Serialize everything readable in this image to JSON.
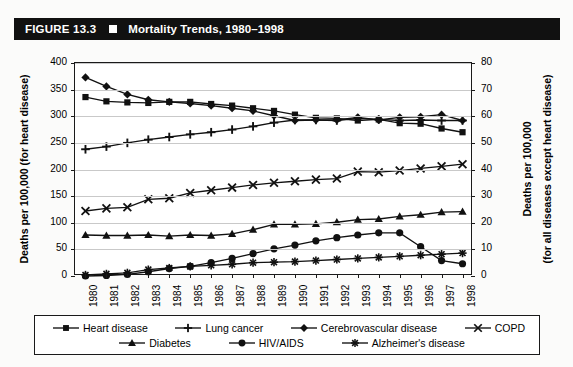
{
  "figure": {
    "number": "FIGURE 13.3",
    "title": "Mortality Trends, 1980–1998",
    "marker_icon": "filled-square-icon"
  },
  "chart_data": {
    "type": "line",
    "title": "Mortality Trends, 1980–1998",
    "xlabel": "",
    "ylabel": "Deaths per 100,000 (for heart disease)",
    "ylabel_right_line1": "Deaths per 100,000",
    "ylabel_right_line2": "(for all diseases except heart disease)",
    "x": [
      1980,
      1981,
      1982,
      1983,
      1984,
      1985,
      1986,
      1987,
      1988,
      1989,
      1990,
      1991,
      1992,
      1993,
      1994,
      1995,
      1996,
      1997,
      1998
    ],
    "xtick_labels": [
      "1980",
      "1981",
      "1982",
      "1983",
      "1984",
      "1985",
      "1986",
      "1987",
      "1988",
      "1989",
      "1990",
      "1991",
      "1992",
      "1993",
      "1994",
      "1995",
      "1996",
      "1997",
      "1998"
    ],
    "ylim": [
      0,
      400
    ],
    "yticks": [
      0,
      50,
      100,
      150,
      200,
      250,
      300,
      350,
      400
    ],
    "ylim_right": [
      0,
      80
    ],
    "yticks_right": [
      0,
      10,
      20,
      30,
      40,
      50,
      60,
      70,
      80
    ],
    "grid": true,
    "legend_position": "bottom",
    "series": [
      {
        "name": "Heart disease",
        "marker": "square",
        "axis": "left",
        "values": [
          336,
          328,
          326,
          325,
          327,
          327,
          323,
          320,
          315,
          310,
          303,
          297,
          296,
          292,
          294,
          287,
          286,
          277,
          270
        ]
      },
      {
        "name": "Lung cancer",
        "marker": "plus",
        "axis": "left",
        "values": [
          238,
          243,
          250,
          256,
          261,
          266,
          270,
          275,
          281,
          288,
          293,
          293,
          292,
          296,
          294,
          292,
          293,
          292,
          292
        ]
      },
      {
        "name": "Cerebrovascular disease",
        "marker": "diamond",
        "axis": "left",
        "values": [
          373,
          356,
          341,
          331,
          327,
          324,
          320,
          315,
          310,
          301,
          292,
          293,
          293,
          298,
          293,
          298,
          299,
          303,
          292
        ]
      },
      {
        "name": "COPD",
        "marker": "x",
        "axis": "right",
        "values": [
          24.4,
          25.4,
          25.8,
          28.8,
          29.2,
          31.2,
          32.2,
          33.2,
          34.2,
          35.0,
          35.6,
          36.2,
          36.6,
          39.2,
          39.0,
          39.6,
          40.4,
          41.2,
          42.0
        ]
      },
      {
        "name": "Diabetes",
        "marker": "triangle",
        "axis": "right",
        "values": [
          15.4,
          15.2,
          15.2,
          15.4,
          15.0,
          15.4,
          15.2,
          15.8,
          17.4,
          19.4,
          19.4,
          19.6,
          20.2,
          21.2,
          21.4,
          22.4,
          23.0,
          24.0,
          24.2
        ]
      },
      {
        "name": "HIV/AIDS",
        "marker": "circle",
        "axis": "right",
        "values": [
          0.0,
          0.2,
          0.6,
          1.6,
          2.8,
          3.6,
          5.0,
          6.6,
          8.4,
          10.2,
          11.6,
          13.2,
          14.4,
          15.4,
          16.2,
          16.2,
          11.0,
          5.8,
          4.6
        ]
      },
      {
        "name": "Alzheimer's disease",
        "marker": "asterisk",
        "axis": "right",
        "values": [
          0.4,
          0.8,
          1.2,
          2.4,
          3.0,
          3.6,
          4.0,
          4.4,
          5.0,
          5.2,
          5.4,
          5.8,
          6.2,
          6.6,
          7.0,
          7.4,
          7.8,
          8.2,
          8.6
        ]
      }
    ]
  },
  "legend": {
    "row1": [
      "Heart disease",
      "Lung cancer",
      "Cerebrovascular disease",
      "COPD"
    ],
    "row2": [
      "Diabetes",
      "HIV/AIDS",
      "Alzheimer's disease"
    ]
  }
}
